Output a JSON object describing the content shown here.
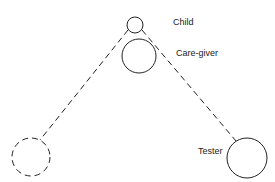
{
  "diagram": {
    "labels": {
      "child": "Child",
      "care_giver": "Care-giver",
      "tester": "Tester"
    },
    "nodes": [
      {
        "id": "child",
        "cx": 135,
        "cy": 25,
        "r": 8,
        "style": "solid"
      },
      {
        "id": "care_giver",
        "cx": 139,
        "cy": 56,
        "r": 17,
        "style": "solid"
      },
      {
        "id": "unlabeled",
        "cx": 31,
        "cy": 157,
        "r": 19,
        "style": "dashed"
      },
      {
        "id": "tester",
        "cx": 247,
        "cy": 158,
        "r": 20,
        "style": "solid"
      }
    ],
    "edges": [
      {
        "from": "child",
        "to": "unlabeled",
        "style": "dashed"
      },
      {
        "from": "child",
        "to": "tester",
        "style": "dashed"
      }
    ],
    "colors": {
      "stroke": "#222222",
      "background": "#ffffff"
    }
  }
}
